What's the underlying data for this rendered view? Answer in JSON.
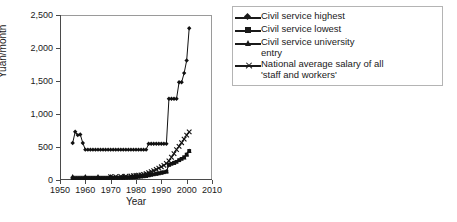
{
  "chart_data": {
    "type": "line",
    "title": "",
    "xlabel": "Year",
    "ylabel": "Yuan/month",
    "xlim": [
      1950,
      2010
    ],
    "ylim": [
      0,
      2500
    ],
    "xticks": [
      1950,
      1960,
      1970,
      1980,
      1990,
      2000,
      2010
    ],
    "ytick_labels": [
      "0",
      "500",
      "1,000",
      "1,500",
      "2,000",
      "2,500"
    ],
    "yticks": [
      0,
      500,
      1000,
      1500,
      2000,
      2500
    ],
    "grid": false,
    "legend_position": "right",
    "series": [
      {
        "name": "Civil service highest",
        "marker": "diamond",
        "x": [
          1955,
          1956,
          1957,
          1958,
          1959,
          1960,
          1961,
          1962,
          1963,
          1964,
          1965,
          1966,
          1967,
          1968,
          1969,
          1970,
          1971,
          1972,
          1973,
          1974,
          1975,
          1976,
          1977,
          1978,
          1979,
          1980,
          1981,
          1982,
          1983,
          1984,
          1985,
          1986,
          1987,
          1988,
          1989,
          1990,
          1991,
          1992,
          1993,
          1994,
          1995,
          1996,
          1997,
          1998,
          1999,
          2000,
          2001
        ],
        "values": [
          560,
          730,
          680,
          690,
          560,
          460,
          460,
          460,
          460,
          460,
          460,
          460,
          460,
          460,
          460,
          460,
          460,
          460,
          460,
          460,
          460,
          460,
          460,
          460,
          460,
          460,
          460,
          460,
          460,
          460,
          550,
          550,
          550,
          550,
          550,
          550,
          550,
          550,
          1230,
          1230,
          1230,
          1230,
          1480,
          1480,
          1620,
          1810,
          2300
        ]
      },
      {
        "name": "Civil service lowest",
        "marker": "square",
        "x": [
          1955,
          1956,
          1957,
          1958,
          1959,
          1960,
          1961,
          1962,
          1963,
          1964,
          1965,
          1966,
          1967,
          1968,
          1969,
          1970,
          1971,
          1972,
          1973,
          1974,
          1975,
          1976,
          1977,
          1978,
          1979,
          1980,
          1981,
          1982,
          1983,
          1984,
          1985,
          1986,
          1987,
          1988,
          1989,
          1990,
          1991,
          1992,
          1993,
          1994,
          1995,
          1996,
          1997,
          1998,
          1999,
          2000,
          2001
        ],
        "values": [
          23,
          23,
          23,
          23,
          23,
          28,
          28,
          28,
          28,
          28,
          28,
          28,
          28,
          28,
          28,
          30,
          30,
          30,
          30,
          32,
          32,
          34,
          36,
          38,
          40,
          44,
          48,
          52,
          56,
          60,
          70,
          78,
          86,
          94,
          100,
          110,
          118,
          126,
          230,
          245,
          260,
          275,
          300,
          320,
          345,
          385,
          440
        ]
      },
      {
        "name": "Civil service university entry",
        "marker": "triangle",
        "x": [
          1955,
          1960,
          1965,
          1970,
          1975,
          1980,
          1985,
          1988,
          1990,
          1992,
          1993,
          1995,
          1997,
          1999,
          2000,
          2001
        ],
        "values": [
          56,
          56,
          56,
          56,
          58,
          62,
          78,
          96,
          112,
          130,
          235,
          262,
          300,
          340,
          385,
          440
        ]
      },
      {
        "name": "National average salary of all 'staff and workers'",
        "marker": "cross",
        "x": [
          1970,
          1972,
          1974,
          1976,
          1978,
          1979,
          1980,
          1981,
          1982,
          1983,
          1984,
          1985,
          1986,
          1987,
          1988,
          1989,
          1990,
          1991,
          1992,
          1993,
          1994,
          1995,
          1996,
          1997,
          1998,
          1999,
          2000,
          2001
        ],
        "values": [
          50,
          52,
          54,
          56,
          60,
          64,
          68,
          72,
          78,
          84,
          96,
          110,
          126,
          140,
          160,
          180,
          200,
          222,
          250,
          290,
          345,
          400,
          460,
          510,
          565,
          620,
          680,
          730
        ]
      }
    ]
  },
  "legend": {
    "items": [
      {
        "label": "Civil service highest",
        "label2": "",
        "marker": "diamond"
      },
      {
        "label": "Civil service lowest",
        "label2": "",
        "marker": "square"
      },
      {
        "label": "Civil service university",
        "label2": "entry",
        "marker": "triangle"
      },
      {
        "label": "National average salary of all",
        "label2": "'staff and workers'",
        "marker": "cross"
      }
    ]
  }
}
